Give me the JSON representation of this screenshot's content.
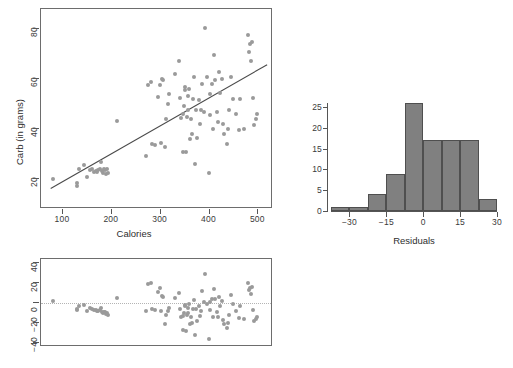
{
  "chart_data": [
    {
      "type": "scatter",
      "title": "",
      "xlabel": "Calories",
      "ylabel": "Carb (in grams)",
      "xlim": [
        55,
        530
      ],
      "ylim": [
        8,
        88
      ],
      "xticks": [
        100,
        200,
        300,
        400,
        500
      ],
      "yticks": [
        20,
        40,
        60,
        80
      ],
      "grid": false,
      "legend": null,
      "marker_color": "#9a9a9a",
      "fit_line": {
        "type": "linear-regression",
        "color": "#4a4a4a",
        "x_start": 75,
        "y_start": 15.5,
        "x_end": 522,
        "y_end": 65.5
      },
      "x": [
        80,
        128,
        128,
        132,
        143,
        150,
        155,
        160,
        163,
        167,
        170,
        172,
        175,
        178,
        180,
        182,
        185,
        186,
        188,
        190,
        192,
        210,
        270,
        275,
        280,
        283,
        288,
        295,
        298,
        300,
        302,
        305,
        308,
        310,
        315,
        318,
        330,
        338,
        340,
        342,
        345,
        346,
        348,
        350,
        350,
        352,
        354,
        355,
        356,
        358,
        360,
        362,
        364,
        366,
        368,
        370,
        372,
        375,
        378,
        380,
        382,
        385,
        388,
        390,
        395,
        398,
        400,
        402,
        405,
        408,
        410,
        412,
        415,
        418,
        420,
        422,
        425,
        428,
        430,
        435,
        438,
        440,
        445,
        448,
        455,
        460,
        462,
        470,
        478,
        480,
        482,
        485,
        488,
        490,
        492,
        495,
        498
      ],
      "y": [
        20.2,
        18.6,
        17.3,
        24.0,
        25.5,
        21.0,
        23.8,
        24.0,
        23.0,
        23.3,
        22.8,
        23.6,
        24.2,
        27.0,
        23.2,
        22.5,
        24.0,
        23.8,
        22.0,
        24.2,
        22.4,
        43.2,
        29.4,
        57.8,
        59.0,
        34.0,
        33.8,
        53.0,
        57.6,
        34.4,
        60.2,
        59.8,
        33.0,
        44.2,
        50.0,
        54.0,
        62.0,
        67.2,
        52.4,
        44.6,
        31.0,
        46.0,
        49.2,
        57.0,
        55.8,
        30.8,
        45.0,
        53.2,
        47.6,
        56.2,
        36.0,
        44.0,
        38.0,
        52.0,
        61.0,
        26.0,
        47.8,
        36.6,
        51.6,
        42.0,
        47.8,
        58.0,
        47.0,
        80.4,
        61.0,
        22.6,
        45.6,
        54.0,
        58.2,
        40.2,
        69.6,
        59.6,
        47.0,
        43.0,
        63.0,
        54.6,
        60.0,
        42.0,
        38.0,
        34.0,
        40.0,
        47.6,
        61.0,
        52.0,
        46.0,
        39.6,
        52.0,
        40.2,
        77.6,
        71.0,
        74.0,
        67.4,
        75.0,
        52.6,
        41.8,
        44.0,
        46.0
      ]
    },
    {
      "type": "scatter",
      "title": "",
      "xlabel": "",
      "ylabel": "",
      "xlim": [
        55,
        530
      ],
      "ylim": [
        -44,
        44
      ],
      "xticks": [],
      "yticks": [
        -40,
        -20,
        0,
        20,
        40
      ],
      "grid": false,
      "legend": null,
      "marker_color": "#9a9a9a",
      "reference_line": {
        "y": 0,
        "style": "dotted",
        "color": "#b4b4b4"
      },
      "x": [
        80,
        128,
        128,
        132,
        143,
        150,
        155,
        160,
        163,
        167,
        170,
        172,
        175,
        178,
        180,
        182,
        185,
        186,
        188,
        190,
        192,
        210,
        270,
        275,
        280,
        283,
        288,
        295,
        298,
        300,
        302,
        305,
        308,
        310,
        315,
        318,
        330,
        338,
        340,
        342,
        345,
        346,
        348,
        350,
        350,
        352,
        354,
        355,
        356,
        358,
        360,
        362,
        364,
        366,
        368,
        370,
        372,
        375,
        378,
        380,
        382,
        385,
        388,
        390,
        395,
        398,
        400,
        402,
        405,
        408,
        410,
        412,
        415,
        418,
        420,
        422,
        425,
        428,
        430,
        435,
        438,
        440,
        445,
        448,
        455,
        460,
        462,
        470,
        478,
        480,
        482,
        485,
        488,
        490,
        492,
        495,
        498
      ],
      "y": [
        2.5,
        -5.8,
        -7.1,
        -2.6,
        -2.0,
        -7.5,
        -5.2,
        -5.6,
        -7.0,
        -7.2,
        -8.2,
        -7.6,
        -7.4,
        -4.6,
        -8.8,
        -9.8,
        -8.8,
        -9.1,
        -11.4,
        -9.5,
        -11.9,
        4.8,
        -8.4,
        19.4,
        20.0,
        -6.0,
        -6.8,
        11.4,
        15.4,
        -8.0,
        7.2,
        6.4,
        -20.6,
        -12.0,
        -8.0,
        -4.6,
        5.4,
        9.6,
        -5.6,
        -13.6,
        -27.4,
        -12.6,
        -9.6,
        -2.0,
        -3.2,
        -28.0,
        -12.4,
        -5.0,
        -10.2,
        -1.0,
        -21.4,
        -13.8,
        -20.0,
        -6.4,
        3.4,
        -32.0,
        -5.6,
        -17.6,
        -3.0,
        -12.8,
        -8.0,
        12.0,
        0.6,
        29.4,
        -0.8,
        -36.4,
        -7.0,
        1.0,
        4.4,
        -14.0,
        14.0,
        3.6,
        -9.0,
        -13.6,
        6.0,
        -2.6,
        2.2,
        -16.6,
        -20.8,
        -25.4,
        -19.6,
        -12.2,
        8.0,
        -1.2,
        -8.0,
        -15.0,
        -3.0,
        -15.6,
        19.6,
        12.6,
        15.4,
        8.6,
        16.0,
        -6.6,
        -18.0,
        -15.6,
        -13.8
      ]
    },
    {
      "type": "bar",
      "subtype": "histogram",
      "title": "",
      "xlabel": "Residuals",
      "ylabel": "",
      "xlim": [
        -37.5,
        30
      ],
      "ylim": [
        0,
        26
      ],
      "xticks": [
        -30,
        -15,
        0,
        15,
        30
      ],
      "yticks": [
        0,
        5,
        10,
        15,
        20,
        25
      ],
      "grid": false,
      "legend": null,
      "bar_color": "#808080",
      "bar_edge_color": "#4f4f4f",
      "bin_width": 7.5,
      "bin_edges": [
        -37.5,
        -30,
        -22.5,
        -15,
        -7.5,
        0,
        7.5,
        15,
        22.5,
        30
      ],
      "categories": [
        "-37.5 to -30",
        "-30 to -22.5",
        "-22.5 to -15",
        "-15 to -7.5",
        "-7.5 to 0",
        "0 to 7.5",
        "7.5 to 15",
        "15 to 22.5",
        "22.5 to 30"
      ],
      "values": [
        1,
        1,
        4,
        9,
        26,
        17,
        17,
        17,
        3
      ]
    }
  ]
}
